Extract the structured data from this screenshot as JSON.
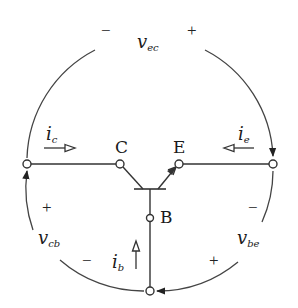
{
  "diagram": {
    "colors": {
      "stroke": "#333333",
      "text": "#1a1a1a",
      "background": "#ffffff"
    },
    "terminals": {
      "collector": {
        "label": "C"
      },
      "emitter": {
        "label": "E"
      },
      "base": {
        "label": "B"
      }
    },
    "currents": {
      "ic": {
        "sym": "i",
        "sub": "c",
        "direction": "right"
      },
      "ie": {
        "sym": "i",
        "sub": "e",
        "direction": "left"
      },
      "ib": {
        "sym": "i",
        "sub": "b",
        "direction": "up"
      }
    },
    "voltages": {
      "vec": {
        "sym": "v",
        "sub": "ec",
        "minus": "−",
        "plus": "+"
      },
      "vcb": {
        "sym": "v",
        "sub": "cb",
        "minus": "−",
        "plus": "+"
      },
      "vbe": {
        "sym": "v",
        "sub": "be",
        "minus": "−",
        "plus": "+"
      }
    }
  }
}
